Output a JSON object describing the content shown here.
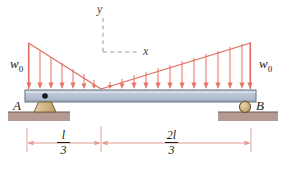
{
  "figure": {
    "colors": {
      "load_line": "#e8766b",
      "load_arrow": "#e8766b",
      "beam_fill": "#b9c4d4",
      "beam_stroke": "#5a6472",
      "support_fill": "#d9bd8e",
      "support_stroke": "#6b5a38",
      "ground_fill": "#b59a93",
      "ground_stroke": "#7a6158",
      "axis_dash": "#9a9a9a",
      "dim_line": "#e8a9a2",
      "text": "#1a1a1a"
    }
  },
  "labels": {
    "load_left": "w",
    "load_left_sub": "0",
    "load_right": "w",
    "load_right_sub": "0",
    "support_a": "A",
    "support_b": "B",
    "axis_y": "y",
    "axis_x": "x"
  },
  "dimensions": [
    {
      "name": "left-span",
      "numerator": "l",
      "denominator": "3"
    },
    {
      "name": "right-span",
      "numerator": "2l",
      "denominator": "3"
    }
  ],
  "geometry": {
    "beam": {
      "x1": 25,
      "x2": 256,
      "y_top": 90,
      "y_bottom": 102
    },
    "load_apex_left_x": 28,
    "load_apex_right_x": 250,
    "load_peak_y": 43,
    "load_valley_x": 101,
    "support_a_x": 45,
    "support_b_x": 245,
    "axis_origin": {
      "x": 103,
      "y": 52
    },
    "dimension_y": 143,
    "tick_left_x": 27,
    "tick_mid_x": 101,
    "tick_right_x": 251
  }
}
